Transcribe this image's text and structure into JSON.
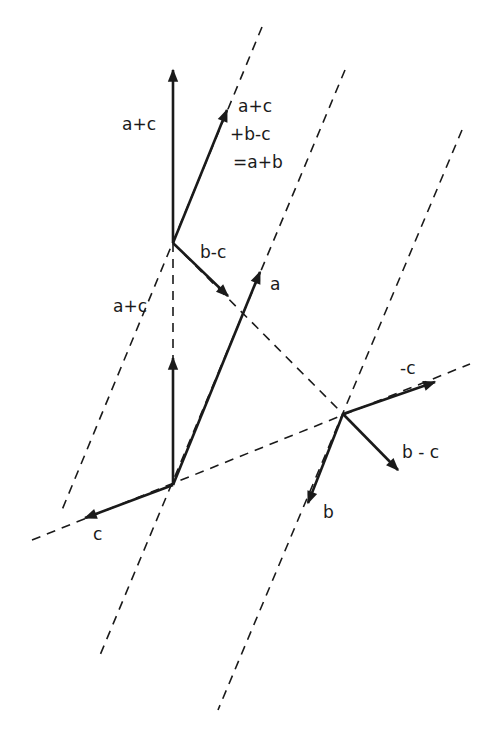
{
  "diagram": {
    "ink_color": "#1a1a1a",
    "background": "#ffffff",
    "labels": {
      "a_plus_c_top": "a+c",
      "sum_line1": "a+c",
      "sum_line2": "+b-c",
      "sum_line3": "=a+b",
      "b_minus_c_upper": "b-c",
      "a": "a",
      "a_plus_c_lower": "a+c",
      "neg_c": "-c",
      "b_minus_c_right": "b - c",
      "b": "b",
      "c": "c"
    }
  }
}
